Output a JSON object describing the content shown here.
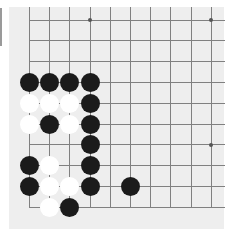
{
  "board": {
    "columns": 10,
    "rows": 10,
    "origin_x": 29.5,
    "origin_y": 20,
    "spacing_x": 20.2,
    "spacing_y": 20.8,
    "edges": {
      "left": true,
      "bottom": true,
      "top": false,
      "right": false
    },
    "colors": {
      "background": "#eeeeee",
      "line": "#808080",
      "black": "#1b1b1b",
      "white": "#ffffff"
    },
    "star_points": [
      [
        3,
        0
      ],
      [
        9,
        0
      ],
      [
        9,
        6
      ]
    ],
    "stones": [
      {
        "col": 0,
        "row": 3,
        "color": "black"
      },
      {
        "col": 1,
        "row": 3,
        "color": "black"
      },
      {
        "col": 2,
        "row": 3,
        "color": "black"
      },
      {
        "col": 3,
        "row": 3,
        "color": "black"
      },
      {
        "col": 0,
        "row": 4,
        "color": "white"
      },
      {
        "col": 1,
        "row": 4,
        "color": "white"
      },
      {
        "col": 2,
        "row": 4,
        "color": "white"
      },
      {
        "col": 3,
        "row": 4,
        "color": "black"
      },
      {
        "col": 0,
        "row": 5,
        "color": "white"
      },
      {
        "col": 1,
        "row": 5,
        "color": "black"
      },
      {
        "col": 2,
        "row": 5,
        "color": "white"
      },
      {
        "col": 3,
        "row": 5,
        "color": "black"
      },
      {
        "col": 3,
        "row": 6,
        "color": "black"
      },
      {
        "col": 0,
        "row": 7,
        "color": "black"
      },
      {
        "col": 1,
        "row": 7,
        "color": "white"
      },
      {
        "col": 3,
        "row": 7,
        "color": "black"
      },
      {
        "col": 0,
        "row": 8,
        "color": "black"
      },
      {
        "col": 1,
        "row": 8,
        "color": "white"
      },
      {
        "col": 2,
        "row": 8,
        "color": "white"
      },
      {
        "col": 3,
        "row": 8,
        "color": "black"
      },
      {
        "col": 5,
        "row": 8,
        "color": "black"
      },
      {
        "col": 1,
        "row": 9,
        "color": "white"
      },
      {
        "col": 2,
        "row": 9,
        "color": "black"
      }
    ]
  }
}
